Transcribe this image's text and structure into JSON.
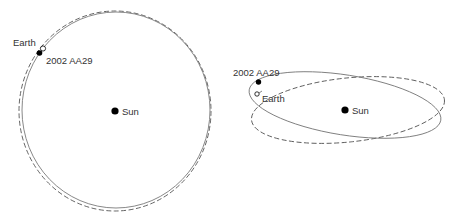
{
  "diagram": {
    "type": "orbital-diagram",
    "colors": {
      "orbit_solid": "#7a7a7a",
      "orbit_dashed": "#555555",
      "marker": "#000000",
      "text": "#333333",
      "background": "#ffffff"
    },
    "left_panel": {
      "view": "top-down",
      "labels": {
        "earth": "Earth",
        "asteroid": "2002 AA29",
        "sun": "Sun"
      }
    },
    "right_panel": {
      "view": "inclined",
      "labels": {
        "earth": "Earth",
        "asteroid": "2002 AA29",
        "sun": "Sun"
      }
    },
    "legend_implicit": {
      "solid_line": "2002 AA29 orbit",
      "dashed_line": "Earth orbit"
    }
  }
}
